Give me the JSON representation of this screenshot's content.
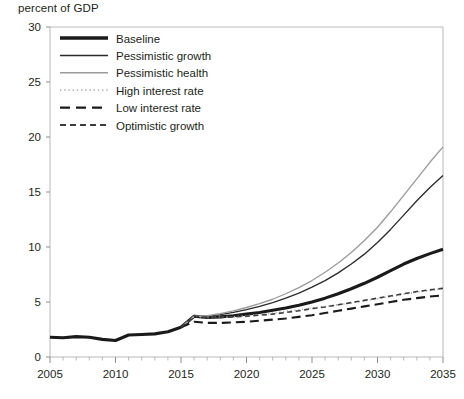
{
  "chart_data": {
    "type": "line",
    "title": "percent of GDP",
    "xlabel": "",
    "ylabel": "percent of GDP",
    "xlim": [
      2005,
      2035
    ],
    "ylim": [
      0,
      30
    ],
    "ytick_labels": [
      "0",
      "5",
      "10",
      "15",
      "20",
      "25",
      "30"
    ],
    "yticks": [
      0,
      5,
      10,
      15,
      20,
      25,
      30
    ],
    "xtick_labels": [
      "2005",
      "2010",
      "2015",
      "2020",
      "2025",
      "2030",
      "2035"
    ],
    "xticks": [
      2005,
      2010,
      2015,
      2020,
      2025,
      2030,
      2035
    ],
    "x_minor_tick_step": 1,
    "grid": false,
    "legend_position": "top-left inside plot",
    "history_x": [
      2005,
      2006,
      2007,
      2008,
      2009,
      2010,
      2011,
      2012,
      2013,
      2014,
      2015
    ],
    "history_y": [
      1.8,
      1.75,
      1.85,
      1.8,
      1.6,
      1.5,
      2.0,
      2.05,
      2.1,
      2.3,
      2.7
    ],
    "series": [
      {
        "name": "Baseline",
        "style": "solid-thick-black",
        "color": "#1a1a1a",
        "width": 3.1,
        "dash": "none",
        "x": [
          2015,
          2016,
          2017,
          2018,
          2019,
          2020,
          2021,
          2022,
          2023,
          2024,
          2025,
          2026,
          2027,
          2028,
          2029,
          2030,
          2031,
          2032,
          2033,
          2034,
          2035
        ],
        "values": [
          2.7,
          3.7,
          3.6,
          3.65,
          3.75,
          3.9,
          4.05,
          4.25,
          4.45,
          4.7,
          5.0,
          5.35,
          5.75,
          6.2,
          6.7,
          7.25,
          7.85,
          8.45,
          8.95,
          9.4,
          9.8
        ]
      },
      {
        "name": "Pessimistic growth",
        "style": "solid-thin-black",
        "color": "#2b2b2b",
        "width": 1.35,
        "dash": "none",
        "x": [
          2015,
          2016,
          2017,
          2018,
          2019,
          2020,
          2021,
          2022,
          2023,
          2024,
          2025,
          2026,
          2027,
          2028,
          2029,
          2030,
          2031,
          2032,
          2033,
          2034,
          2035
        ],
        "values": [
          2.7,
          3.7,
          3.7,
          3.85,
          4.05,
          4.3,
          4.6,
          4.95,
          5.35,
          5.8,
          6.35,
          6.95,
          7.65,
          8.45,
          9.35,
          10.4,
          11.6,
          12.9,
          14.2,
          15.4,
          16.5
        ]
      },
      {
        "name": "Pessimistic health",
        "style": "solid-thin-gray",
        "color": "#9b9b9b",
        "width": 1.35,
        "dash": "none",
        "x": [
          2015,
          2016,
          2017,
          2018,
          2019,
          2020,
          2021,
          2022,
          2023,
          2024,
          2025,
          2026,
          2027,
          2028,
          2029,
          2030,
          2031,
          2032,
          2033,
          2034,
          2035
        ],
        "values": [
          2.7,
          3.7,
          3.75,
          3.95,
          4.2,
          4.5,
          4.85,
          5.25,
          5.75,
          6.3,
          6.95,
          7.7,
          8.55,
          9.5,
          10.6,
          11.8,
          13.2,
          14.7,
          16.2,
          17.7,
          19.1
        ]
      },
      {
        "name": "High interest rate",
        "style": "dotted-light",
        "color": "#b0b0b0",
        "width": 1.6,
        "dash": "1.2 2.6",
        "x": [
          2015,
          2016,
          2017,
          2018,
          2019,
          2020,
          2021,
          2022,
          2023,
          2024,
          2025,
          2026,
          2027,
          2028,
          2029,
          2030,
          2031,
          2032,
          2033,
          2034,
          2035
        ],
        "values": [
          2.7,
          3.7,
          3.6,
          3.6,
          3.65,
          3.75,
          3.85,
          4.0,
          4.15,
          4.3,
          4.45,
          4.6,
          4.75,
          4.9,
          5.1,
          5.3,
          5.5,
          5.7,
          5.9,
          6.05,
          6.2
        ]
      },
      {
        "name": "Low interest rate",
        "style": "long-dash",
        "color": "#1a1a1a",
        "width": 2.1,
        "dash": "9 5",
        "x": [
          2015,
          2016,
          2017,
          2018,
          2019,
          2020,
          2021,
          2022,
          2023,
          2024,
          2025,
          2026,
          2027,
          2028,
          2029,
          2030,
          2031,
          2032,
          2033,
          2034,
          2035
        ],
        "values": [
          2.7,
          3.2,
          3.1,
          3.1,
          3.15,
          3.2,
          3.3,
          3.4,
          3.5,
          3.65,
          3.8,
          4.0,
          4.2,
          4.4,
          4.6,
          4.8,
          5.0,
          5.2,
          5.35,
          5.5,
          5.6
        ]
      },
      {
        "name": "Optimistic growth",
        "style": "short-dash",
        "color": "#3d3d3d",
        "width": 1.6,
        "dash": "5 3.5",
        "x": [
          2015,
          2016,
          2017,
          2018,
          2019,
          2020,
          2021,
          2022,
          2023,
          2024,
          2025,
          2026,
          2027,
          2028,
          2029,
          2030,
          2031,
          2032,
          2033,
          2034,
          2035
        ],
        "values": [
          2.7,
          3.7,
          3.6,
          3.6,
          3.65,
          3.7,
          3.8,
          3.9,
          4.05,
          4.2,
          4.4,
          4.55,
          4.75,
          4.95,
          5.15,
          5.35,
          5.55,
          5.75,
          5.95,
          6.1,
          6.25
        ]
      }
    ],
    "legend": [
      {
        "label": "Baseline",
        "color": "#1a1a1a",
        "width": 3.4,
        "dash": "none"
      },
      {
        "label": "Pessimistic growth",
        "color": "#2b2b2b",
        "width": 1.5,
        "dash": "none"
      },
      {
        "label": "Pessimistic health",
        "color": "#9b9b9b",
        "width": 1.5,
        "dash": "none"
      },
      {
        "label": "High interest rate",
        "color": "#b8b8b8",
        "width": 1.8,
        "dash": "1.4 2.8"
      },
      {
        "label": "Low interest rate",
        "color": "#1a1a1a",
        "width": 2.4,
        "dash": "10 6"
      },
      {
        "label": "Optimistic growth",
        "color": "#3d3d3d",
        "width": 1.9,
        "dash": "6 4"
      }
    ]
  }
}
